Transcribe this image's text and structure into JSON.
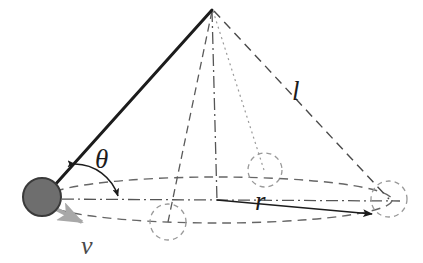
{
  "figure": {
    "kind": "conical-pendulum-diagram",
    "title": "",
    "background_color": "#ffffff"
  },
  "labels": {
    "angle": "θ",
    "length": "l",
    "radius": "r",
    "velocity": "v"
  },
  "colors": {
    "stroke_dark": "#1c1c1c",
    "stroke_medium": "#555555",
    "stroke_light": "#8a8a8a",
    "bob_fill": "#6e6e6e",
    "bob_stroke": "#3a3a3a",
    "velocity_arrow": "#a8a8a8"
  },
  "geometry": {
    "apex": {
      "x": 212,
      "y": 10
    },
    "circle_center": {
      "x": 217,
      "y": 200
    },
    "ellipse_rx": 175,
    "ellipse_ry": 23,
    "bob": {
      "x": 42,
      "y": 197,
      "r": 18
    },
    "ghost_bobs": [
      {
        "x": 168,
        "y": 222,
        "r": 18
      },
      {
        "x": 265,
        "y": 170,
        "r": 17
      },
      {
        "x": 389,
        "y": 199,
        "r": 18
      }
    ],
    "radius_arrow": {
      "x1": 217,
      "y1": 200,
      "x2": 375,
      "y2": 215
    },
    "velocity_arrow": {
      "x1": 54,
      "y1": 209,
      "x2": 104,
      "y2": 234
    }
  },
  "elements": {
    "string_solid": "string-from-apex-to-bob",
    "axis_dashdot": "vertical-axis-line",
    "dashed_to_ghost1": "apex-to-ghost-bob-front",
    "dotted_to_ghost2": "apex-to-ghost-bob-back",
    "dashed_to_ghost3": "apex-to-ghost-bob-right",
    "horizontal_dashdot": "horizontal-center-line",
    "orbit_ellipse": "circular-orbit-path",
    "theta_arc": "angle-arc-with-arrows"
  }
}
